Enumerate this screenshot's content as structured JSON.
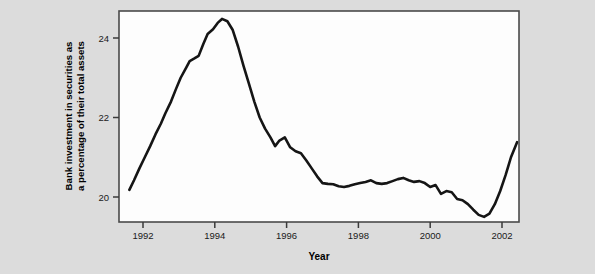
{
  "chart_data": {
    "type": "line",
    "title": "",
    "xlabel": "Year",
    "ylabel": "Bank investment in securities as a percentage of their total assets",
    "ylabel_line1": "Bank investment in securities as",
    "ylabel_line2": "a percentage of their total assets",
    "xlim": [
      1991.55,
      1992.0
    ],
    "xlim_actual": [
      1991.33,
      1992.0
    ],
    "x_axis_range": [
      1991.33,
      2002.5
    ],
    "ylim": [
      19.36,
      24.66
    ],
    "xticks": [
      1992,
      1994,
      1996,
      1998,
      2000,
      2002
    ],
    "xticklabels": [
      "1992",
      "1994",
      "1996",
      "1998",
      "2000",
      "2002"
    ],
    "yticks": [
      20,
      22,
      24
    ],
    "yticklabels": [
      "20",
      "22",
      "24"
    ],
    "grid": false,
    "legend": null,
    "line_color": "#151515",
    "plot_background": "#fdfdfd",
    "figure_background": "#dcdcdc",
    "series": [
      {
        "name": "Bank investment in securities",
        "x": [
          1991.62,
          1991.75,
          1991.9,
          1992.05,
          1992.2,
          1992.35,
          1992.5,
          1992.62,
          1992.78,
          1992.92,
          1993.05,
          1993.2,
          1993.3,
          1993.42,
          1993.55,
          1993.68,
          1993.8,
          1993.95,
          1994.08,
          1994.2,
          1994.35,
          1994.5,
          1994.65,
          1994.8,
          1994.95,
          1995.1,
          1995.25,
          1995.4,
          1995.55,
          1995.68,
          1995.8,
          1995.95,
          1996.1,
          1996.25,
          1996.4,
          1996.55,
          1996.7,
          1996.85,
          1997.0,
          1997.15,
          1997.3,
          1997.45,
          1997.6,
          1997.75,
          1997.9,
          1998.05,
          1998.2,
          1998.35,
          1998.5,
          1998.65,
          1998.8,
          1998.95,
          1999.1,
          1999.25,
          1999.4,
          1999.55,
          1999.7,
          1999.85,
          2000.0,
          2000.15,
          2000.3,
          2000.45,
          2000.6,
          2000.75,
          2000.9,
          2001.05,
          2001.2,
          2001.35,
          2001.5,
          2001.65,
          2001.8,
          2001.95,
          2002.1,
          2002.25,
          2002.42
        ],
        "values": [
          20.18,
          20.42,
          20.72,
          21.0,
          21.28,
          21.58,
          21.85,
          22.1,
          22.4,
          22.72,
          23.0,
          23.25,
          23.42,
          23.48,
          23.55,
          23.85,
          24.1,
          24.22,
          24.38,
          24.48,
          24.42,
          24.2,
          23.78,
          23.3,
          22.85,
          22.4,
          22.0,
          21.72,
          21.5,
          21.28,
          21.42,
          21.5,
          21.25,
          21.15,
          21.1,
          20.92,
          20.72,
          20.52,
          20.35,
          20.33,
          20.32,
          20.27,
          20.25,
          20.28,
          20.32,
          20.35,
          20.38,
          20.42,
          20.35,
          20.33,
          20.35,
          20.4,
          20.45,
          20.48,
          20.42,
          20.38,
          20.4,
          20.35,
          20.25,
          20.3,
          20.08,
          20.15,
          20.12,
          19.95,
          19.92,
          19.82,
          19.68,
          19.55,
          19.5,
          19.58,
          19.82,
          20.15,
          20.55,
          21.0,
          21.38
        ]
      }
    ]
  },
  "axes": {
    "y_tick_labels": [
      "24",
      "22",
      "20"
    ],
    "x_tick_labels": [
      "1992",
      "1994",
      "1996",
      "1998",
      "2000",
      "2002"
    ],
    "x_axis_title": "Year",
    "y_axis_title_line1": "Bank investment in securities as",
    "y_axis_title_line2": "a percentage of their total assets"
  }
}
